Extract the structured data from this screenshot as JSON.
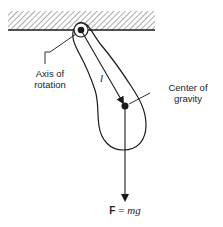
{
  "diagram": {
    "labels": {
      "axis_line1": "Axis of",
      "axis_line2": "rotation",
      "cog_line1": "Center of",
      "cog_line2": "gravity",
      "length": "l",
      "force_bold": "F",
      "force_eq": " = ",
      "force_rhs": "mg"
    },
    "colors": {
      "ink": "#1a1a1a",
      "background": "#ffffff"
    }
  }
}
